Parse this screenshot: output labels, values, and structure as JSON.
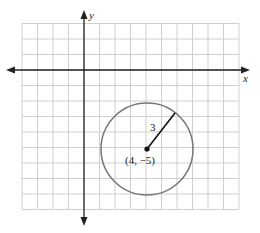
{
  "figure": {
    "x_axis_label": "x",
    "y_axis_label": "y",
    "circle": {
      "center": {
        "x": 4,
        "y": -5
      },
      "center_label": "(4, −5)",
      "radius": 3,
      "radius_label": "3"
    },
    "grid": {
      "x_min": -4,
      "x_max": 10,
      "y_min": -9,
      "y_max": 3,
      "step": 1
    },
    "colors": {
      "grid": "#cfcfcf",
      "axis": "#222222",
      "circle": "#777777",
      "radius": "#111111"
    }
  }
}
